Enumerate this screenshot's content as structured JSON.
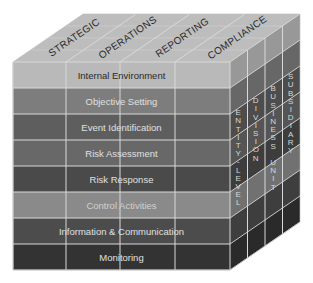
{
  "diagram": {
    "top_face": {
      "labels": [
        "STRATEGIC",
        "OPERATIONS",
        "REPORTING",
        "COMPLIANCE"
      ],
      "color": "#bdbdbd"
    },
    "front_face": {
      "rows": [
        {
          "label": "Internal Environment",
          "color": "#b9b9b9",
          "text_color": "#2a2a2a"
        },
        {
          "label": "Objective Setting",
          "color": "#7d7d7d",
          "text_color": "#e0e0e0"
        },
        {
          "label": "Event Identification",
          "color": "#5e5e5e",
          "text_color": "#e0e0e0"
        },
        {
          "label": "Risk Assessment",
          "color": "#686868",
          "text_color": "#e0e0e0"
        },
        {
          "label": "Risk Response",
          "color": "#4a4a4a",
          "text_color": "#e0e0e0"
        },
        {
          "label": "Control Activities",
          "color": "#8a8a8a",
          "text_color": "#d0d0d0"
        },
        {
          "label": "Information & Communication",
          "color": "#4c4c4c",
          "text_color": "#e0e0e0"
        },
        {
          "label": "Monitoring",
          "color": "#333333",
          "text_color": "#e0e0e0"
        }
      ]
    },
    "side_face": {
      "labels": [
        "ENTITY-LEVEL",
        "DIVISION",
        "BUSINESS UNIT",
        "SUBSIDIARY"
      ]
    },
    "grid_line_color": "#d9d9d9"
  }
}
